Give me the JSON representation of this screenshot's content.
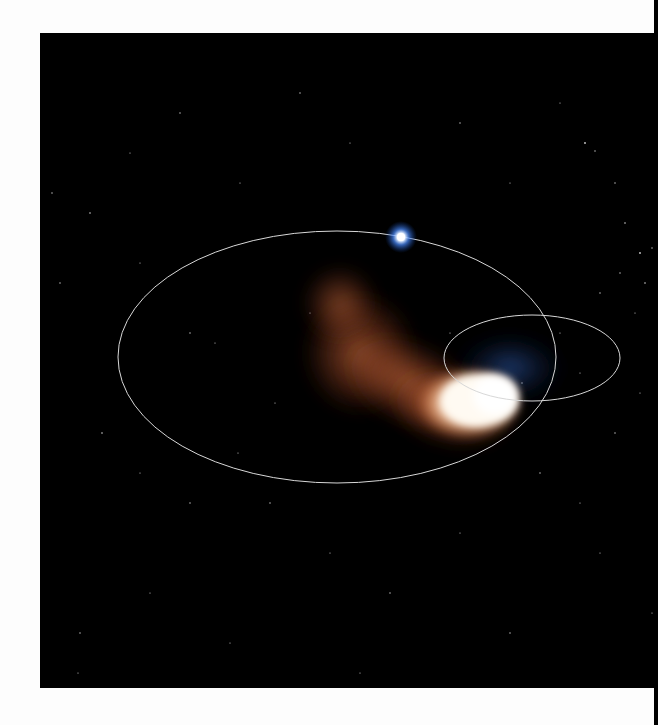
{
  "figure": {
    "colors": {
      "page_background": "#fdfdfd",
      "sky": "#000000",
      "orbit_line": "#d8d8d8",
      "star_core": "#ffffff",
      "star_glow": "#3a7bff",
      "comet_head": "#fff6e8",
      "comet_tail": "#c8643a"
    },
    "elements": {
      "large_orbit": {
        "cx": 297,
        "cy": 324,
        "rx": 219,
        "ry": 126
      },
      "small_orbit": {
        "cx": 492,
        "cy": 325,
        "rx": 88,
        "ry": 43
      },
      "blue_star": {
        "cx": 361,
        "cy": 204
      },
      "comet_head": {
        "cx": 440,
        "cy": 367
      }
    }
  }
}
